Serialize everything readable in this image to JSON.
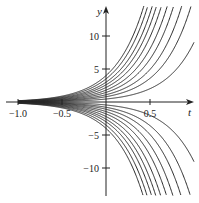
{
  "chart_data": {
    "type": "line",
    "title": "",
    "xlabel": "t",
    "ylabel": "y",
    "xlim": [
      -1.0,
      1.0
    ],
    "ylim": [
      -14,
      14
    ],
    "grid": false,
    "legend": null,
    "x_ticks": [
      {
        "value": -1.0,
        "label": "−1.0"
      },
      {
        "value": -0.5,
        "label": "−0.5"
      },
      {
        "value": 0.5,
        "label": "0.5"
      }
    ],
    "y_ticks": [
      {
        "value": 10,
        "label": "10"
      },
      {
        "value": 5,
        "label": "5"
      },
      {
        "value": -5,
        "label": "−5"
      },
      {
        "value": -10,
        "label": "−10"
      }
    ],
    "family": "y = C·e^(3t)",
    "series_constants": [
      4.0,
      3.5,
      3.0,
      2.6,
      2.2,
      1.8,
      1.45,
      1.1,
      0.8,
      0.45,
      -0.45,
      -0.8,
      -1.1,
      -1.45,
      -1.8,
      -2.2,
      -2.6,
      -3.0,
      -3.5,
      -4.0
    ],
    "t_start": -1.0,
    "line_color": "#2a2a2a"
  }
}
